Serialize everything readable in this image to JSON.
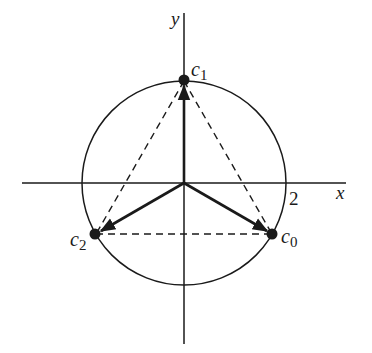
{
  "figure": {
    "colors": {
      "ink": "#1a1a1a",
      "background": "#ffffff"
    },
    "axes": {
      "x_label": "x",
      "y_label": "y",
      "tick_label": "2"
    },
    "circle": {
      "radius_value": 2
    },
    "points": [
      {
        "id": "c0",
        "label": "c",
        "subscript": "0",
        "angle_deg": -30
      },
      {
        "id": "c1",
        "label": "c",
        "subscript": "1",
        "angle_deg": 90
      },
      {
        "id": "c2",
        "label": "c",
        "subscript": "2",
        "angle_deg": 210
      }
    ],
    "edges_style": "dashed",
    "vectors_style": "solid-arrow"
  }
}
